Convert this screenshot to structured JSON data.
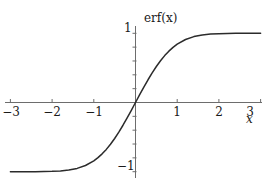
{
  "chart_data": {
    "type": "line",
    "title": "",
    "curve_label": "erf(x)",
    "xlabel": "x",
    "ylabel": "",
    "xlim": [
      -3.3,
      3.3
    ],
    "ylim": [
      -1.18,
      1.18
    ],
    "xticks": [
      -3,
      -2,
      -1,
      1,
      2,
      3
    ],
    "xtick_labels": [
      "−3",
      "−2",
      "−1",
      "1",
      "2",
      "3"
    ],
    "yticks": [
      -1,
      1
    ],
    "ytick_labels": [
      "−1",
      "1"
    ],
    "y_minor_ticks": [
      -1.0,
      -0.8,
      -0.6,
      -0.4,
      -0.2,
      0.2,
      0.4,
      0.6,
      0.8,
      1.0
    ],
    "grid": false,
    "legend": "none",
    "line_color": "#2b2b2b",
    "axis_color": "#6d6d6d",
    "background": "#ffffff",
    "series": [
      {
        "name": "erf(x)",
        "x": [
          -3.0,
          -2.8,
          -2.6,
          -2.4,
          -2.2,
          -2.0,
          -1.8,
          -1.6,
          -1.4,
          -1.2,
          -1.0,
          -0.9,
          -0.8,
          -0.7,
          -0.6,
          -0.5,
          -0.4,
          -0.3,
          -0.2,
          -0.1,
          0.0,
          0.1,
          0.2,
          0.3,
          0.4,
          0.5,
          0.6,
          0.7,
          0.8,
          0.9,
          1.0,
          1.2,
          1.4,
          1.6,
          1.8,
          2.0,
          2.2,
          2.4,
          2.6,
          2.8,
          3.0
        ],
        "y": [
          -1.0,
          -0.9999,
          -0.9998,
          -0.9993,
          -0.9981,
          -0.9953,
          -0.9891,
          -0.9763,
          -0.9523,
          -0.9103,
          -0.8427,
          -0.7969,
          -0.7421,
          -0.6778,
          -0.6039,
          -0.5205,
          -0.4284,
          -0.3286,
          -0.2227,
          -0.1125,
          0.0,
          0.1125,
          0.2227,
          0.3286,
          0.4284,
          0.5205,
          0.6039,
          0.6778,
          0.7421,
          0.7969,
          0.8427,
          0.9103,
          0.9523,
          0.9763,
          0.9891,
          0.9953,
          0.9981,
          0.9993,
          0.9998,
          0.9999,
          1.0
        ]
      }
    ]
  },
  "labels": {
    "curve": "erf(x)",
    "x_axis": "x",
    "y_top": "1",
    "y_bottom": "−1",
    "x_neg3": "−3",
    "x_neg2": "−2",
    "x_neg1": "−1",
    "x_pos1": "1",
    "x_pos2": "2",
    "x_pos3": "3"
  }
}
